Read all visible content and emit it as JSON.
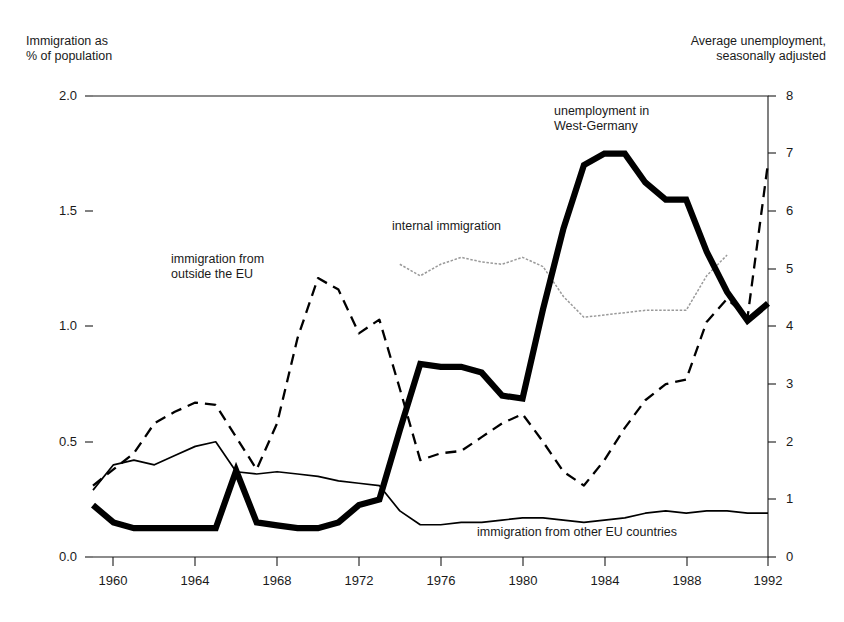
{
  "chart_data": {
    "type": "line",
    "title": "",
    "subtitle": "",
    "xlabel": "",
    "ylabel": "Immigration as\n% of population",
    "y2label": "Average unemployment,\nseasonally adjusted",
    "grid": false,
    "legend_position": "inline-annotations",
    "xlim": [
      1959,
      1992
    ],
    "ylim": [
      0.0,
      2.0
    ],
    "y2lim": [
      0,
      8
    ],
    "xticks": [
      1960,
      1964,
      1968,
      1972,
      1976,
      1980,
      1984,
      1988,
      1992
    ],
    "xtick_labels": [
      "1960",
      "1964",
      "1968",
      "1972",
      "1976",
      "1980",
      "1984",
      "1988",
      "1992"
    ],
    "yticks": [
      0.0,
      0.5,
      1.0,
      1.5,
      2.0
    ],
    "ytick_labels": [
      "0.0",
      "0.5",
      "1.0",
      "1.5",
      "2.0"
    ],
    "y2ticks": [
      0,
      1,
      2,
      3,
      4,
      5,
      6,
      7,
      8
    ],
    "y2tick_labels": [
      "0",
      "1",
      "2",
      "3",
      "4",
      "5",
      "6",
      "7",
      "8"
    ],
    "series": [
      {
        "name": "unemployment in West-Germany",
        "axis": "right",
        "style": "thick-solid",
        "color": "#000000",
        "label_text": "unemployment in\nWest-Germany",
        "x": [
          1959,
          1960,
          1961,
          1962,
          1963,
          1964,
          1965,
          1966,
          1967,
          1968,
          1969,
          1970,
          1971,
          1972,
          1973,
          1974,
          1975,
          1976,
          1977,
          1978,
          1979,
          1980,
          1981,
          1982,
          1983,
          1984,
          1985,
          1986,
          1987,
          1988,
          1989,
          1990,
          1991,
          1992
        ],
        "values": [
          0.9,
          0.6,
          0.5,
          0.5,
          0.5,
          0.5,
          0.5,
          1.5,
          0.6,
          0.55,
          0.5,
          0.5,
          0.6,
          0.9,
          1.0,
          2.2,
          3.35,
          3.3,
          3.3,
          3.2,
          2.8,
          2.75,
          4.3,
          5.7,
          6.8,
          7.0,
          7.0,
          6.5,
          6.2,
          6.2,
          5.3,
          4.6,
          4.1,
          4.4
        ]
      },
      {
        "name": "immigration from outside the EU",
        "axis": "left",
        "style": "dashed",
        "color": "#000000",
        "label_text": "immigration from\noutside the EU",
        "x": [
          1959,
          1960,
          1961,
          1962,
          1963,
          1964,
          1965,
          1966,
          1967,
          1968,
          1969,
          1970,
          1971,
          1972,
          1973,
          1974,
          1975,
          1976,
          1977,
          1978,
          1979,
          1980,
          1981,
          1982,
          1983,
          1984,
          1985,
          1986,
          1987,
          1988,
          1989,
          1990,
          1991,
          1992
        ],
        "values": [
          0.31,
          0.38,
          0.45,
          0.58,
          0.63,
          0.67,
          0.66,
          0.52,
          0.38,
          0.58,
          0.95,
          1.21,
          1.16,
          0.97,
          1.03,
          0.73,
          0.42,
          0.45,
          0.46,
          0.52,
          0.58,
          0.62,
          0.5,
          0.37,
          0.31,
          0.42,
          0.56,
          0.68,
          0.75,
          0.77,
          1.02,
          1.12,
          1.04,
          1.71
        ]
      },
      {
        "name": "internal immigration",
        "axis": "left",
        "style": "dotted-gray",
        "color": "#9a9a9a",
        "label_text": "internal immigration",
        "x": [
          1974,
          1975,
          1976,
          1977,
          1978,
          1979,
          1980,
          1981,
          1982,
          1983,
          1984,
          1985,
          1986,
          1987,
          1988,
          1989,
          1990
        ],
        "values": [
          1.27,
          1.22,
          1.27,
          1.3,
          1.28,
          1.27,
          1.3,
          1.26,
          1.13,
          1.04,
          1.05,
          1.06,
          1.07,
          1.07,
          1.07,
          1.22,
          1.31
        ]
      },
      {
        "name": "immigration from other EU countries",
        "axis": "left",
        "style": "thin-solid",
        "color": "#000000",
        "label_text": "immigration from other EU countries",
        "x": [
          1959,
          1960,
          1961,
          1962,
          1963,
          1964,
          1965,
          1966,
          1967,
          1968,
          1969,
          1970,
          1971,
          1972,
          1973,
          1974,
          1975,
          1976,
          1977,
          1978,
          1979,
          1980,
          1981,
          1982,
          1983,
          1984,
          1985,
          1986,
          1987,
          1988,
          1989,
          1990,
          1991,
          1992
        ],
        "values": [
          0.29,
          0.4,
          0.42,
          0.4,
          0.44,
          0.48,
          0.5,
          0.37,
          0.36,
          0.37,
          0.36,
          0.35,
          0.33,
          0.32,
          0.31,
          0.2,
          0.14,
          0.14,
          0.15,
          0.15,
          0.16,
          0.17,
          0.17,
          0.16,
          0.15,
          0.16,
          0.17,
          0.19,
          0.2,
          0.19,
          0.2,
          0.2,
          0.19,
          0.19
        ]
      }
    ]
  },
  "axes": {
    "left_caption": "Immigration as\n% of population",
    "right_caption": "Average unemployment,\nseasonally adjusted",
    "left_ticks": [
      "2.0",
      "1.5",
      "1.0",
      "0.5",
      "0.0"
    ],
    "right_ticks": [
      "8",
      "7",
      "6",
      "5",
      "4",
      "3",
      "2",
      "1",
      "0"
    ],
    "bottom_ticks": [
      "1960",
      "1964",
      "1968",
      "1972",
      "1976",
      "1980",
      "1984",
      "1988",
      "1992"
    ]
  },
  "annotations": {
    "outside_eu": "immigration from\noutside the EU",
    "internal": "internal immigration",
    "unemployment": "unemployment in\nWest-Germany",
    "other_eu": "immigration from other EU countries"
  }
}
